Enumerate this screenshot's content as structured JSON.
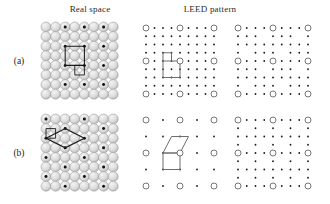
{
  "figure": {
    "headings": {
      "real_space": "Real space",
      "leed_pattern": "LEED pattern"
    },
    "row_labels": {
      "a": "(a)",
      "b": "(b)"
    }
  },
  "colors": {
    "sphere_fill": "#dcdcdc",
    "sphere_edge": "#8a8a8a",
    "sphere_highlight": "#f4f4f4",
    "adatom": "#101010",
    "cell_line": "#1a1a1a",
    "recip_cell_line": "#6e6e6e",
    "substrate_spot_edge": "#555555",
    "super_spot": "#1a1a1a",
    "background": "#ffffff",
    "text": "#2b2b2b"
  },
  "chart_data": [
    {
      "id": "a-real",
      "type": "scatter",
      "title": "Real space (a)",
      "xlabel": "",
      "ylabel": "",
      "grid": false,
      "description": "Square substrate lattice of close-packed spheres, 8 columns by 8 rows, with adsorbate atoms (filled black dots) occupying a p(2x2) arrangement. A rectangular overlayer unit cell spanning 2 substrate spacings in x and 2 in y is drawn through four adatoms, and a small square marks the single substrate (1x1) unit cell.",
      "lattice": {
        "columns": 8,
        "rows": 8,
        "spacing_x": 9.6,
        "spacing_y": 9.6,
        "row_offset": 0
      },
      "adatoms": [
        [
          2,
          2
        ],
        [
          4,
          2
        ],
        [
          6,
          2
        ],
        [
          2,
          4
        ],
        [
          4,
          4
        ],
        [
          6,
          4
        ],
        [
          2,
          6
        ],
        [
          4,
          6
        ],
        [
          6,
          6
        ],
        [
          2,
          0
        ],
        [
          4,
          0
        ],
        [
          6,
          0
        ]
      ],
      "overlayer_cell": {
        "shape": "rectangle",
        "vertices": [
          [
            2,
            2
          ],
          [
            4,
            2
          ],
          [
            4,
            4
          ],
          [
            2,
            4
          ]
        ],
        "label": "p(2x2) overlayer cell"
      },
      "substrate_cell": {
        "shape": "square",
        "vertices": [
          [
            3,
            4
          ],
          [
            4,
            4
          ],
          [
            4,
            5
          ],
          [
            3,
            5
          ]
        ],
        "label": "1x1 substrate cell"
      }
    },
    {
      "id": "a-leed1",
      "type": "scatter",
      "title": "LEED pattern (a) single domain",
      "xlabel": "",
      "ylabel": "",
      "grid": false,
      "description": "Reciprocal lattice for the p(2x2)-type overlayer of row (a). Large open circles are the integer-order substrate spots arranged 3 by 3; small filled dots are the fractional-order superstructure spots forming a 5 by 5 mesh between them. A reciprocal unit cell is outlined in gray.",
      "substrate_spots": {
        "columns": 3,
        "rows": 3,
        "marker": "open-circle",
        "radius_px": 3.0
      },
      "super_spots": {
        "mesh_columns": 9,
        "mesh_rows": 9,
        "marker": "filled-dot",
        "radius_px": 0.9,
        "fraction_x": 0.25,
        "fraction_y": 0.25
      },
      "reciprocal_cell": {
        "shape": "rectangle-with-tail",
        "vertices": [
          [
            0.5,
            1.0
          ],
          [
            1.0,
            1.0
          ],
          [
            1.0,
            0.5
          ],
          [
            0.5,
            0.5
          ]
        ],
        "stub": [
          [
            0.5,
            1.0
          ],
          [
            0.5,
            1.25
          ],
          [
            0.75,
            1.25
          ],
          [
            0.75,
            1.0
          ]
        ]
      }
    },
    {
      "id": "a-leed2",
      "type": "scatter",
      "title": "LEED pattern (a) multiple domains",
      "xlabel": "",
      "ylabel": "",
      "grid": false,
      "description": "Superposition of the LEED patterns from all rotational and translational domains of structure (a). Integer-order substrate spots remain as large open circles in a 3 by 3 array, while the fractional spots fill in a dense 9 by 9 mesh of small dots.",
      "substrate_spots": {
        "columns": 3,
        "rows": 3,
        "marker": "open-circle",
        "radius_px": 3.0
      },
      "super_spots": {
        "mesh_columns": 9,
        "mesh_rows": 9,
        "marker": "filled-dot",
        "radius_px": 0.9
      }
    },
    {
      "id": "b-real",
      "type": "scatter",
      "title": "Real space (b)",
      "xlabel": "",
      "ylabel": "",
      "grid": false,
      "description": "Same square substrate lattice of spheres, 8 columns by 8 rows, with adsorbate atoms arranged on an oblique (sheared) superlattice. A parallelogram overlayer unit cell is drawn through four adatoms and a small square marks the 1x1 substrate cell.",
      "lattice": {
        "columns": 8,
        "rows": 8,
        "spacing_x": 9.6,
        "spacing_y": 9.6,
        "row_offset": 0
      },
      "adatoms": [
        [
          0,
          0
        ],
        [
          4,
          0
        ],
        [
          2,
          1
        ],
        [
          6,
          1
        ],
        [
          0,
          2
        ],
        [
          4,
          2
        ],
        [
          2,
          3
        ],
        [
          6,
          3
        ],
        [
          0,
          4
        ],
        [
          4,
          4
        ],
        [
          2,
          5
        ],
        [
          6,
          5
        ],
        [
          0,
          6
        ],
        [
          4,
          6
        ],
        [
          2,
          7
        ],
        [
          6,
          7
        ]
      ],
      "overlayer_cell": {
        "shape": "parallelogram",
        "vertices": [
          [
            2,
            1
          ],
          [
            4,
            2
          ],
          [
            2,
            3
          ],
          [
            0,
            2
          ]
        ],
        "label": "oblique overlayer cell"
      },
      "substrate_cell": {
        "shape": "square",
        "vertices": [
          [
            0,
            1
          ],
          [
            1,
            1
          ],
          [
            1,
            2
          ],
          [
            0,
            2
          ]
        ],
        "label": "1x1 substrate cell"
      }
    },
    {
      "id": "b-leed1",
      "type": "scatter",
      "title": "LEED pattern (b) single domain",
      "xlabel": "",
      "ylabel": "",
      "grid": false,
      "description": "Reciprocal lattice of the oblique overlayer of row (b). Large open circles mark the 3 by 3 integer-order substrate spots; small dots mark the half-order superstructure spots. A square reciprocal cell and an adjoining sheared parallelogram cell are outlined, showing the oblique reciprocal vectors.",
      "substrate_spots": {
        "columns": 3,
        "rows": 3,
        "marker": "open-circle",
        "radius_px": 3.0
      },
      "super_spots": {
        "mesh_columns": 5,
        "mesh_rows": 5,
        "marker": "filled-dot",
        "radius_px": 0.9,
        "fraction_x": 0.5,
        "fraction_y": 0.5
      },
      "reciprocal_cell": {
        "shape": "square",
        "vertices": [
          [
            0.5,
            0.5
          ],
          [
            1.0,
            0.5
          ],
          [
            1.0,
            1.0
          ],
          [
            0.5,
            1.0
          ]
        ]
      },
      "oblique_cell": {
        "shape": "parallelogram",
        "vertices": [
          [
            0.5,
            1.0
          ],
          [
            1.0,
            1.0
          ],
          [
            1.25,
            1.5
          ],
          [
            0.75,
            1.5
          ]
        ]
      }
    },
    {
      "id": "b-leed2",
      "type": "scatter",
      "title": "LEED pattern (b) multiple domains",
      "xlabel": "",
      "ylabel": "",
      "grid": false,
      "description": "Superposition of LEED patterns from all domains of structure (b). Large open circles are the 3 by 3 integer-order substrate spots; clusters of small fractional-order dots appear around the half-order positions, producing characteristic split spots.",
      "substrate_spots": {
        "columns": 3,
        "rows": 3,
        "marker": "open-circle",
        "radius_px": 3.0
      },
      "super_spots": {
        "marker": "filled-dot",
        "radius_px": 0.9,
        "pattern": "split-spot clusters at half-order positions"
      }
    }
  ]
}
